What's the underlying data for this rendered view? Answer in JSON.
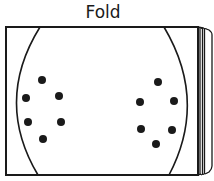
{
  "title": "Fold",
  "colors": {
    "stroke": "#1a1a1a",
    "dot": "#1a1a1a",
    "background": "#ffffff"
  },
  "sheet": {
    "x": 6,
    "y": 27,
    "width": 192,
    "height": 148,
    "stacked_pages": 5
  },
  "oval": {
    "top_left_x": 40,
    "top_right_x": 164,
    "bottom_left_x": 38,
    "bottom_right_x": 169
  },
  "dots": {
    "left_group": [
      {
        "x": 42,
        "y": 80
      },
      {
        "x": 26,
        "y": 98
      },
      {
        "x": 59,
        "y": 96
      },
      {
        "x": 28,
        "y": 122
      },
      {
        "x": 61,
        "y": 122
      },
      {
        "x": 43,
        "y": 139
      }
    ],
    "right_group": [
      {
        "x": 158,
        "y": 82
      },
      {
        "x": 140,
        "y": 102
      },
      {
        "x": 174,
        "y": 101
      },
      {
        "x": 141,
        "y": 129
      },
      {
        "x": 172,
        "y": 130
      },
      {
        "x": 156,
        "y": 144
      }
    ]
  }
}
